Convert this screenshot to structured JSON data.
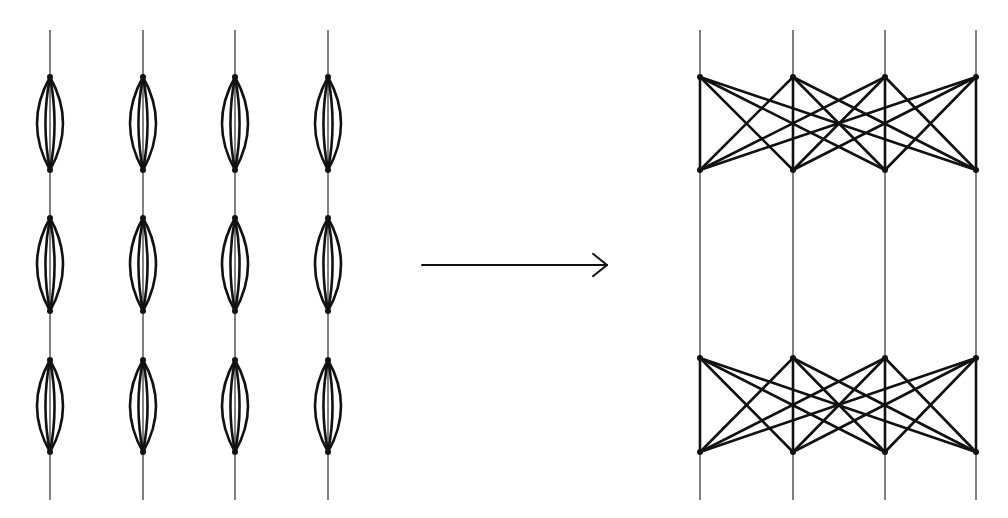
{
  "diagram": {
    "type": "graph-transformation",
    "colors": {
      "wire": "#808080",
      "edge": "#111111",
      "background": "#ffffff"
    },
    "left_graph": {
      "name": "chain-of-multiedge-lenses",
      "columns_x": [
        50,
        143,
        235,
        328
      ],
      "line_span": [
        30,
        500
      ],
      "lens_blocks": [
        {
          "top": 77,
          "bottom": 170
        },
        {
          "top": 218,
          "bottom": 311
        },
        {
          "top": 360,
          "bottom": 452
        }
      ],
      "edges_per_lens": 4,
      "lens_half_widths": [
        20,
        7
      ]
    },
    "arrow": {
      "x1": 422,
      "x2": 607,
      "y": 265,
      "head": 14
    },
    "right_graph": {
      "name": "complete-bipartite-crossings",
      "columns_x": [
        700,
        793,
        885,
        976
      ],
      "line_span": [
        30,
        500
      ],
      "blocks": [
        {
          "top": 77,
          "bottom": 170
        },
        {
          "top": 358,
          "bottom": 452
        }
      ],
      "edge_rule": "each top node connects to every bottom node"
    }
  }
}
